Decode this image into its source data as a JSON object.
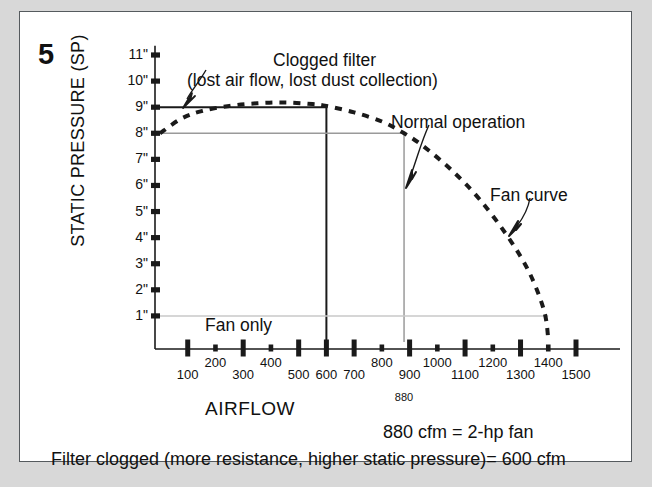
{
  "figure": {
    "number": "5",
    "axis_title_y": "STATIC PRESSURE (SP)",
    "axis_title_x": "AIRFLOW"
  },
  "annotations": {
    "clogged_line1": "Clogged filter",
    "clogged_line2": "(lost air flow, lost dust collection)",
    "normal_operation": "Normal operation",
    "fan_curve": "Fan curve",
    "fan_only": "Fan only",
    "marker_880": "880"
  },
  "notes": {
    "cfm_fan": "880 cfm = 2-hp fan",
    "filter_clogged": "Filter clogged (more resistance, higher static pressure)= 600 cfm"
  },
  "colors": {
    "line_dark": "#1a1a1a",
    "line_gray": "#9a9a9a",
    "line_light_gray": "#c9c9c9",
    "frame_border": "#555a5e",
    "page_bg": "#d8d8d8",
    "chart_bg": "#ffffff"
  },
  "chart_data": {
    "type": "line",
    "xlabel": "AIRFLOW",
    "ylabel": "STATIC PRESSURE (SP)",
    "xlim": [
      0,
      1500
    ],
    "ylim": [
      0,
      11
    ],
    "grid": false,
    "legend": "none",
    "x_tick_labels": [
      "100",
      "200",
      "300",
      "400",
      "500",
      "600",
      "700",
      "800",
      "900",
      "1000",
      "1100",
      "1200",
      "1300",
      "1400",
      "1500"
    ],
    "x_tick_values": [
      100,
      200,
      300,
      400,
      500,
      600,
      700,
      800,
      900,
      1000,
      1100,
      1200,
      1300,
      1400,
      1500
    ],
    "x_tick_major": [
      100,
      300,
      500,
      600,
      700,
      900,
      1100,
      1300,
      1500
    ],
    "y_tick_labels": [
      "1\"",
      "2\"",
      "3\"",
      "4\"",
      "5\"",
      "6\"",
      "7\"",
      "8\"",
      "9\"",
      "10\"",
      "11\""
    ],
    "y_tick_values": [
      1,
      2,
      3,
      4,
      5,
      6,
      7,
      8,
      9,
      10,
      11
    ],
    "series": [
      {
        "name": "Fan curve",
        "style": "dashed",
        "color": "#1a1a1a",
        "x": [
          0,
          75,
          150,
          250,
          350,
          450,
          550,
          600,
          700,
          800,
          880,
          950,
          1050,
          1150,
          1250,
          1330,
          1385,
          1400
        ],
        "y": [
          8.0,
          8.55,
          8.85,
          9.05,
          9.15,
          9.18,
          9.12,
          9.05,
          8.8,
          8.45,
          8.0,
          7.5,
          6.6,
          5.5,
          4.1,
          2.7,
          1.2,
          0.1
        ]
      }
    ],
    "reference_lines": [
      {
        "name": "clogged-filter-sp",
        "orientation": "horizontal",
        "value": 9,
        "x_from": 0,
        "x_to": 600,
        "color": "#1a1a1a",
        "width": 2
      },
      {
        "name": "clogged-filter-flow",
        "orientation": "vertical",
        "value": 600,
        "y_from": 0,
        "y_to": 9,
        "color": "#1a1a1a",
        "width": 2
      },
      {
        "name": "normal-operation-sp",
        "orientation": "horizontal",
        "value": 8,
        "x_from": 0,
        "x_to": 880,
        "color": "#9a9a9a",
        "width": 1.5
      },
      {
        "name": "normal-operation-flow",
        "orientation": "vertical",
        "value": 880,
        "y_from": 0,
        "y_to": 8,
        "color": "#9a9a9a",
        "width": 1.5
      },
      {
        "name": "fan-only-sp",
        "orientation": "horizontal",
        "value": 1,
        "x_from": 0,
        "x_to": 1400,
        "color": "#c9c9c9",
        "width": 1.5
      }
    ],
    "operating_points": [
      {
        "name": "clogged filter",
        "airflow_cfm": 600,
        "static_pressure_in": 9
      },
      {
        "name": "normal operation",
        "airflow_cfm": 880,
        "static_pressure_in": 8
      },
      {
        "name": "fan only",
        "airflow_cfm": 1400,
        "static_pressure_in": 1
      }
    ]
  }
}
